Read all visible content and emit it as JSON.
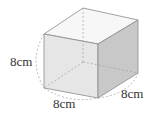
{
  "figure": {
    "shape": "cube",
    "labels": {
      "height": "8cm",
      "width": "8cm",
      "depth": "8cm"
    },
    "colors": {
      "top_face": "#f7f7f7",
      "front_face": "#e6e6e6",
      "side_face": "#c8c8c8",
      "edge": "#8a8a8a",
      "hidden_edge": "#a0a0a0",
      "arc": "#9a9a9a",
      "label": "#333333"
    }
  }
}
